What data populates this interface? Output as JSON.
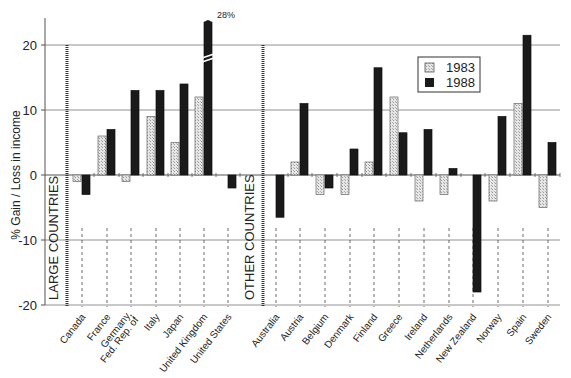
{
  "chart_data": {
    "type": "bar",
    "title": "",
    "xlabel": "",
    "ylabel": "% Gain / Loss in income",
    "ylim": [
      -20,
      25
    ],
    "yticks": [
      20,
      10,
      0,
      -10,
      -20
    ],
    "grid": "horizontal",
    "legend_position": "top-right",
    "groups": [
      {
        "name": "LARGE COUNTRIES",
        "categories": [
          "Canada",
          "France",
          "Germany, Fed. Rep. of",
          "Italy",
          "Japan",
          "United Kingdom",
          "United States"
        ]
      },
      {
        "name": "OTHER COUNTRIES",
        "categories": [
          "Australia",
          "Austria",
          "Belgium",
          "Denmark",
          "Finland",
          "Greece",
          "Ireland",
          "Netherlands",
          "New Zealand",
          "Norway",
          "Spain",
          "Sweden"
        ]
      }
    ],
    "categories": [
      "Canada",
      "France",
      "Germany, Fed. Rep. of",
      "Italy",
      "Japan",
      "United Kingdom",
      "United States",
      "Australia",
      "Austria",
      "Belgium",
      "Denmark",
      "Finland",
      "Greece",
      "Ireland",
      "Netherlands",
      "New Zealand",
      "Norway",
      "Spain",
      "Sweden"
    ],
    "series": [
      {
        "name": "1983",
        "pattern": "light-hatched",
        "color": "#d8d8d8",
        "values": [
          -1,
          6,
          -1,
          9,
          5,
          12,
          0,
          0,
          2,
          -3,
          -3,
          2,
          12,
          -4,
          -3,
          0,
          -4,
          11,
          -5
        ]
      },
      {
        "name": "1988",
        "pattern": "solid",
        "color": "#1a1a1a",
        "values": [
          -3,
          7,
          13,
          13,
          14,
          28,
          -2,
          -6.5,
          11,
          -2,
          4,
          16.5,
          6.5,
          7,
          1,
          -18,
          9,
          21.5,
          5
        ]
      }
    ],
    "annotations": [
      {
        "category": "United Kingdom",
        "series": "1988",
        "text": "28%",
        "note": "axis break"
      }
    ]
  }
}
